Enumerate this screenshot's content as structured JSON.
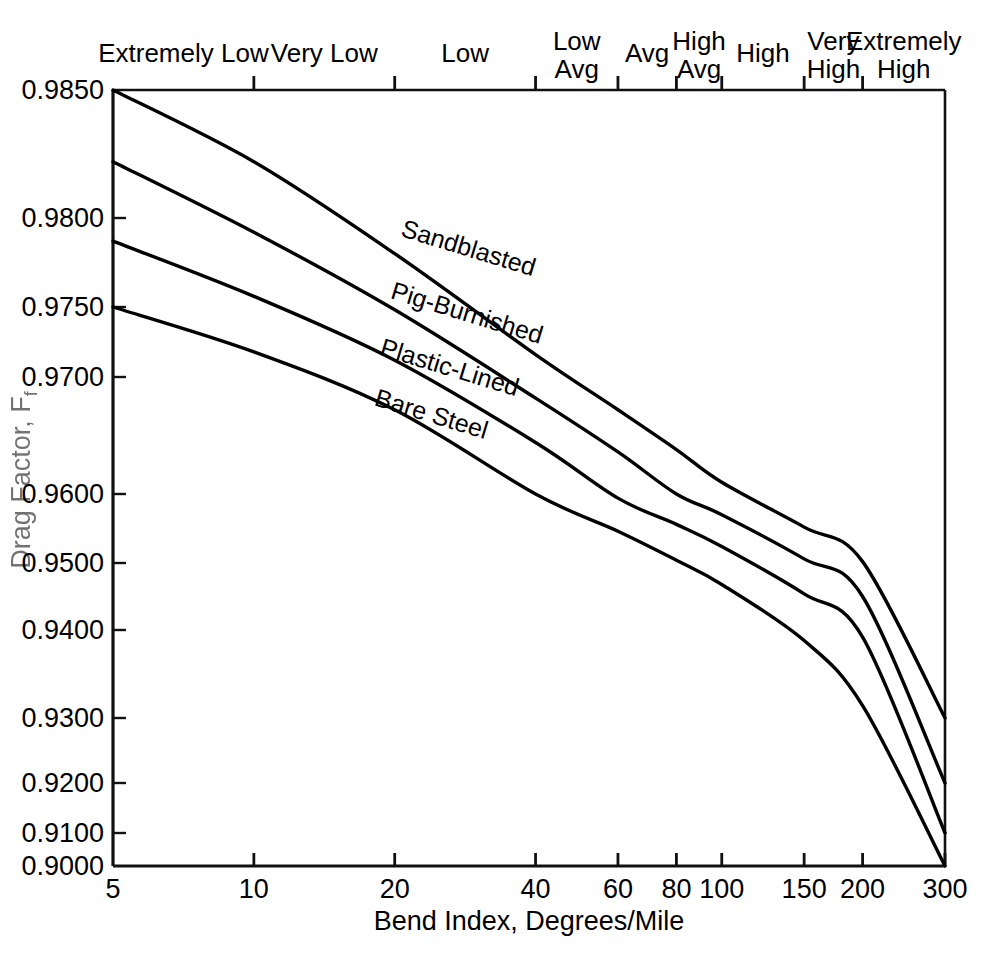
{
  "chart_data": {
    "type": "line",
    "title": "",
    "xlabel": "Bend Index, Degrees/Mile",
    "ylabel": "Drag Factor, F",
    "ylabel_subscript": "f",
    "xscale": "log",
    "xlim": [
      5,
      300
    ],
    "ylim": [
      0.9,
      0.985
    ],
    "grid": false,
    "legend": "inline-curve-labels",
    "xticks": [
      5,
      10,
      20,
      40,
      60,
      80,
      100,
      150,
      200,
      300
    ],
    "xtick_labels": [
      "5",
      "10",
      "20",
      "40",
      "60",
      "80",
      "100",
      "150",
      "200",
      "300"
    ],
    "yticks": [
      0.9,
      0.91,
      0.92,
      0.93,
      0.94,
      0.95,
      0.96,
      0.97,
      0.975,
      0.98,
      0.985
    ],
    "ytick_labels": [
      "0.9000",
      "0.9100",
      "0.9200",
      "0.9300",
      "0.9400",
      "0.9500",
      "0.9600",
      "0.9700",
      "0.9750",
      "0.9800",
      "0.9850"
    ],
    "top_axis_label": "Bend Index Category",
    "top_categories": [
      {
        "label": "Extremely Low",
        "line1": "Extremely Low",
        "line2": "",
        "range": [
          5,
          10
        ]
      },
      {
        "label": "Very Low",
        "line1": "Very Low",
        "line2": "",
        "range": [
          10,
          20
        ]
      },
      {
        "label": "Low",
        "line1": "Low",
        "line2": "",
        "range": [
          20,
          40
        ]
      },
      {
        "label": "Low Avg",
        "line1": "Low",
        "line2": "Avg",
        "range": [
          40,
          60
        ]
      },
      {
        "label": "Avg",
        "line1": "Avg",
        "line2": "",
        "range": [
          60,
          80
        ]
      },
      {
        "label": "High Avg",
        "line1": "High",
        "line2": "Avg",
        "range": [
          80,
          100
        ]
      },
      {
        "label": "High",
        "line1": "High",
        "line2": "",
        "range": [
          100,
          150
        ]
      },
      {
        "label": "Very High",
        "line1": "Very",
        "line2": "High",
        "range": [
          150,
          200
        ]
      },
      {
        "label": "Extremely High",
        "line1": "Extremely",
        "line2": "High",
        "range": [
          200,
          300
        ]
      }
    ],
    "top_tick_values": [
      10,
      20,
      40,
      60,
      80,
      100,
      150,
      200
    ],
    "x": [
      5,
      10,
      20,
      40,
      60,
      80,
      100,
      150,
      200,
      300
    ],
    "series": [
      {
        "name": "Sandblasted",
        "color": "#000000",
        "values": [
          0.985,
          0.9822,
          0.978,
          0.9716,
          0.9672,
          0.9638,
          0.961,
          0.9552,
          0.9502,
          0.93
        ]
      },
      {
        "name": "Pig-Burnished",
        "color": "#000000",
        "values": [
          0.9822,
          0.9792,
          0.9748,
          0.9682,
          0.9636,
          0.96,
          0.957,
          0.9506,
          0.945,
          0.92
        ]
      },
      {
        "name": "Plastic-Lined",
        "color": "#000000",
        "values": [
          0.9787,
          0.9756,
          0.9712,
          0.9644,
          0.9594,
          0.9556,
          0.9524,
          0.9454,
          0.9392,
          0.91
        ]
      },
      {
        "name": "Bare Steel",
        "color": "#000000",
        "values": [
          0.975,
          0.9718,
          0.9672,
          0.96,
          0.9546,
          0.9504,
          0.9468,
          0.9388,
          0.9314,
          0.9
        ]
      }
    ],
    "curve_labels": [
      {
        "text": "Sandblasted",
        "x": 20.5,
        "y": 0.979,
        "rotate": 17
      },
      {
        "text": "Pig-Burnished",
        "x": 19.5,
        "y": 0.9755,
        "rotate": 17
      },
      {
        "text": "Plastic-Lined",
        "x": 18.5,
        "y": 0.9716,
        "rotate": 17
      },
      {
        "text": "Bare Steel",
        "x": 18.0,
        "y": 0.9676,
        "rotate": 17
      }
    ]
  }
}
